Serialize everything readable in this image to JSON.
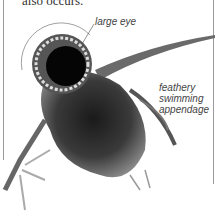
{
  "page": {
    "body_text_fragment": "also occurs."
  },
  "figure": {
    "labels": {
      "eye": "large eye",
      "appendage_line1": "feathery",
      "appendage_line2": "swimming",
      "appendage_line3": "appendage"
    }
  }
}
